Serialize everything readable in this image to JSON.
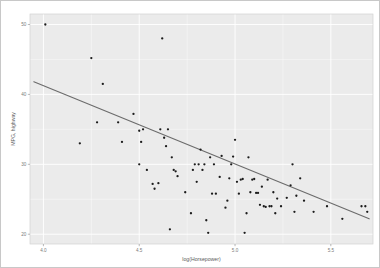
{
  "chart_data": {
    "type": "scatter",
    "title": "",
    "xlabel": "log(Horsepower)",
    "ylabel": "MPG, highway",
    "xlim": [
      3.93,
      5.72
    ],
    "ylim": [
      18.6,
      51.5
    ],
    "xticks": [
      "4.0",
      "4.5",
      "5.0",
      "5.5"
    ],
    "xtick_values": [
      4.0,
      4.5,
      5.0,
      5.5
    ],
    "yticks": [
      "50",
      "40",
      "30",
      "20"
    ],
    "ytick_values": [
      50,
      40,
      30,
      20
    ],
    "grid": true,
    "legend": "none",
    "point_color": "#1b1b1b",
    "line_color": "#6b6b6b",
    "panel_color": "#ebebeb",
    "gridline_color": "#ffffff",
    "fit": {
      "type": "linear",
      "slope": -11.2,
      "intercept": 86.0,
      "x_start": 3.95,
      "x_end": 5.7,
      "y_start": 41.8,
      "y_end": 22.2
    },
    "points": [
      [
        4.01,
        50.0
      ],
      [
        4.19,
        33.0
      ],
      [
        4.25,
        45.2
      ],
      [
        4.28,
        36.0
      ],
      [
        4.31,
        41.5
      ],
      [
        4.39,
        36.0
      ],
      [
        4.41,
        33.2
      ],
      [
        4.47,
        37.2
      ],
      [
        4.5,
        30.0
      ],
      [
        4.5,
        34.8
      ],
      [
        4.51,
        33.2
      ],
      [
        4.52,
        35.0
      ],
      [
        4.54,
        29.2
      ],
      [
        4.57,
        27.2
      ],
      [
        4.58,
        26.5
      ],
      [
        4.6,
        27.3
      ],
      [
        4.61,
        35.0
      ],
      [
        4.62,
        48.0
      ],
      [
        4.63,
        33.8
      ],
      [
        4.64,
        32.6
      ],
      [
        4.65,
        35.0
      ],
      [
        4.66,
        20.7
      ],
      [
        4.67,
        31.0
      ],
      [
        4.68,
        29.2
      ],
      [
        4.69,
        29.0
      ],
      [
        4.7,
        28.3
      ],
      [
        4.74,
        26.0
      ],
      [
        4.77,
        23.0
      ],
      [
        4.78,
        29.2
      ],
      [
        4.79,
        30.0
      ],
      [
        4.8,
        27.5
      ],
      [
        4.81,
        30.0
      ],
      [
        4.82,
        32.1
      ],
      [
        4.83,
        29.2
      ],
      [
        4.84,
        30.0
      ],
      [
        4.85,
        22.0
      ],
      [
        4.86,
        20.2
      ],
      [
        4.87,
        31.0
      ],
      [
        4.88,
        25.8
      ],
      [
        4.89,
        30.0
      ],
      [
        4.9,
        25.8
      ],
      [
        4.92,
        28.2
      ],
      [
        4.93,
        31.2
      ],
      [
        4.95,
        23.8
      ],
      [
        4.96,
        24.8
      ],
      [
        4.97,
        28.0
      ],
      [
        4.98,
        30.0
      ],
      [
        4.99,
        31.1
      ],
      [
        5.0,
        33.5
      ],
      [
        5.01,
        27.5
      ],
      [
        5.02,
        25.8
      ],
      [
        5.03,
        27.8
      ],
      [
        5.04,
        27.9
      ],
      [
        5.05,
        20.2
      ],
      [
        5.06,
        23.0
      ],
      [
        5.07,
        31.0
      ],
      [
        5.08,
        26.0
      ],
      [
        5.09,
        27.8
      ],
      [
        5.1,
        27.9
      ],
      [
        5.11,
        25.9
      ],
      [
        5.12,
        25.9
      ],
      [
        5.13,
        24.2
      ],
      [
        5.14,
        26.8
      ],
      [
        5.15,
        24.0
      ],
      [
        5.16,
        23.9
      ],
      [
        5.17,
        27.8
      ],
      [
        5.18,
        24.0
      ],
      [
        5.19,
        24.0
      ],
      [
        5.2,
        26.0
      ],
      [
        5.21,
        23.0
      ],
      [
        5.22,
        25.1
      ],
      [
        5.24,
        24.0
      ],
      [
        5.27,
        25.2
      ],
      [
        5.29,
        27.0
      ],
      [
        5.3,
        30.0
      ],
      [
        5.31,
        23.2
      ],
      [
        5.32,
        25.5
      ],
      [
        5.34,
        28.0
      ],
      [
        5.36,
        24.8
      ],
      [
        5.41,
        23.2
      ],
      [
        5.48,
        24.0
      ],
      [
        5.56,
        22.2
      ],
      [
        5.66,
        24.0
      ],
      [
        5.68,
        24.0
      ],
      [
        5.69,
        23.2
      ]
    ]
  }
}
